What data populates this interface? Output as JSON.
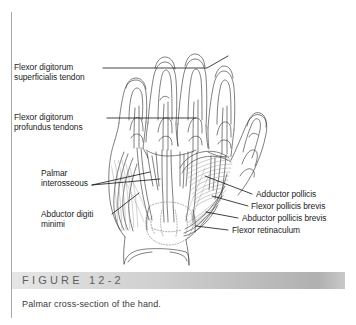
{
  "figure": {
    "number_label": "FIGURE  12-2",
    "caption": "Palmar cross-section of the hand."
  },
  "labels": {
    "left": [
      {
        "id": "flexor-digitorum-superficialis-tendon",
        "line1": "Flexor digitorum",
        "line2": "superficialis tendon"
      },
      {
        "id": "flexor-digitorum-profundus-tendons",
        "line1": "Flexor digitorum",
        "line2": "profundus tendons"
      },
      {
        "id": "palmar-interosseous",
        "line1": "Palmar",
        "line2": "interosseous"
      },
      {
        "id": "abductor-digiti-minimi",
        "line1": "Abductor digiti",
        "line2": "minimi"
      }
    ],
    "right": [
      {
        "id": "adductor-pollicis",
        "text": "Adductor pollicis"
      },
      {
        "id": "flexor-pollicis-brevis",
        "text": "Flexor pollicis brevis"
      },
      {
        "id": "abductor-pollicis-brevis",
        "text": "Abductor pollicis brevis"
      },
      {
        "id": "flexor-retinaculum",
        "text": "Flexor retinaculum"
      }
    ]
  },
  "illustration": {
    "title": "palmar-cross-section-of-hand",
    "subject": "right hand, palmar aspect, superficial dissection",
    "ink_color": "#3b3b3b",
    "fill_color": "#ffffff",
    "shading_color": "#9a9a9a"
  },
  "colors": {
    "band_light": "#e6e6e6",
    "band_dark": "#b0b0b0",
    "rule": "#a8a8a8",
    "text": "#1d1d1d",
    "caption_text": "#3a3a3a",
    "figure_text": "#5f5f5f"
  }
}
